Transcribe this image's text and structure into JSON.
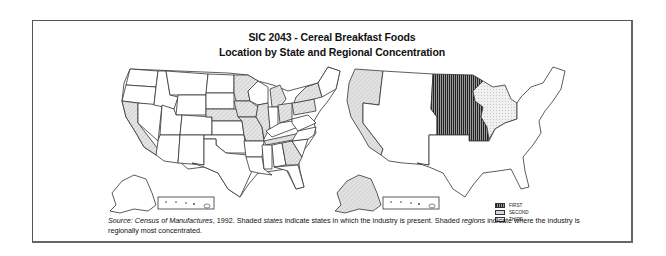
{
  "figure": {
    "title_line1": "SIC 2043 - Cereal Breakfast Foods",
    "title_line2": "Location by State and Regional Concentration"
  },
  "maps": {
    "left": {
      "description": "States in which the industry is present",
      "shaded_states": [
        "CA",
        "MN",
        "NE",
        "IA",
        "MO",
        "IL",
        "MI",
        "OH",
        "PA",
        "NY",
        "TN",
        "GA"
      ]
    },
    "right": {
      "description": "Regional concentration",
      "regions": [
        {
          "rank": "FIRST",
          "region": "West North Central",
          "fill": "#555555"
        },
        {
          "rank": "SECOND",
          "region": "Pacific",
          "fill": "#d8d8d8"
        },
        {
          "rank": "THIRD",
          "region": "East North Central",
          "fill": "#efefef"
        }
      ]
    }
  },
  "legend": {
    "first": "FIRST",
    "second": "SECOND",
    "third": "THIRD"
  },
  "caption": {
    "source_label": "Source:",
    "source_title": "Census of Manufactures",
    "source_year": ", 1992.",
    "text1": " Shaded ",
    "states_word": "states",
    "text2": " indicate states in which the industry is present. Shaded ",
    "regions_word": "regions",
    "text3": " indicate where the industry is regionally most concentrated."
  },
  "colors": {
    "border": "#555555",
    "outline": "#333333",
    "shade_light": "#d8d8d8",
    "shade_dark": "#555555"
  }
}
